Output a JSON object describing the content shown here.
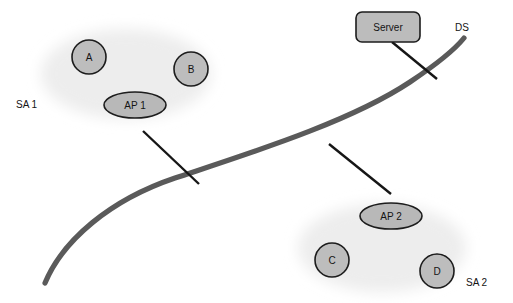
{
  "diagram": {
    "canvas": {
      "width": 513,
      "height": 303
    },
    "colors": {
      "background": "#ffffff",
      "node_fill": "#bdbdbd",
      "node_stroke": "#1c1c1c",
      "cloud_fill": "#ededed",
      "ds_curve": "#5a5a5a",
      "link_line": "#161616",
      "text": "#141414"
    }
  },
  "clouds": [
    {
      "id": "sa1-cloud",
      "label": "SA 1",
      "label_x": 16,
      "label_y": 105,
      "cx": 126,
      "cy": 74,
      "rx": 89,
      "ry": 49
    },
    {
      "id": "sa2-cloud",
      "label": "SA 2",
      "label_x": 466,
      "label_y": 283,
      "cx": 382,
      "cy": 248,
      "rx": 88,
      "ry": 48
    }
  ],
  "stations": [
    {
      "id": "station-a",
      "label": "A",
      "cx": 89,
      "cy": 57,
      "r": 17
    },
    {
      "id": "station-b",
      "label": "B",
      "cx": 191,
      "cy": 69,
      "r": 17
    },
    {
      "id": "station-c",
      "label": "C",
      "cx": 332,
      "cy": 260,
      "r": 17
    },
    {
      "id": "station-d",
      "label": "D",
      "cx": 437,
      "cy": 271,
      "r": 17
    }
  ],
  "access_points": [
    {
      "id": "ap-1",
      "label": "AP 1",
      "cx": 135,
      "cy": 105,
      "rx": 31,
      "ry": 13
    },
    {
      "id": "ap-2",
      "label": "AP 2",
      "cx": 391,
      "cy": 216,
      "rx": 31,
      "ry": 13
    }
  ],
  "server": {
    "id": "server-box",
    "label": "Server",
    "x": 356,
    "y": 12,
    "width": 64,
    "height": 30,
    "corner_radius": 6
  },
  "distribution_system": {
    "id": "ds-curve",
    "label": "DS",
    "label_x": 455,
    "label_y": 28,
    "path": "M 45 283 C 63 240 110 200 175 178 C 250 153 350 122 410 82 C 440 62 456 48 464 38"
  },
  "links": [
    {
      "id": "link-ap1-ds",
      "from": "ap-1",
      "to": "ds",
      "x1": 143,
      "y1": 131,
      "x2": 199,
      "y2": 184
    },
    {
      "id": "link-server-ds",
      "from": "server",
      "to": "ds",
      "x1": 392,
      "y1": 42,
      "x2": 437,
      "y2": 79
    },
    {
      "id": "link-ds-ap2",
      "from": "ds",
      "to": "ap-2",
      "x1": 329,
      "y1": 144,
      "x2": 391,
      "y2": 194
    }
  ]
}
